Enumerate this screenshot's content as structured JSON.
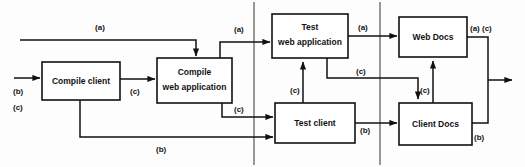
{
  "diagram": {
    "colors": {
      "background": "#fdfdfd",
      "stroke": "#111111",
      "box_fill": "#ffffff",
      "divider": "#555555"
    },
    "nodes": [
      {
        "id": "compile-client",
        "line1": "Compile client",
        "line2": ""
      },
      {
        "id": "compile-web-app",
        "line1": "Compile",
        "line2": "web application"
      },
      {
        "id": "test-web-app",
        "line1": "Test",
        "line2": "web application"
      },
      {
        "id": "test-client",
        "line1": "Test client",
        "line2": ""
      },
      {
        "id": "web-docs",
        "line1": "Web Docs",
        "line2": ""
      },
      {
        "id": "client-docs",
        "line1": "Client Docs",
        "line2": ""
      }
    ],
    "edge_labels": [
      {
        "id": "label-top-a",
        "text": "(a)"
      },
      {
        "id": "label-input-b",
        "text": "(b)"
      },
      {
        "id": "label-input-c",
        "text": "(c)"
      },
      {
        "id": "label-compile-chain-c",
        "text": "(c)"
      },
      {
        "id": "label-stage1-out-a",
        "text": "(a)"
      },
      {
        "id": "label-stage1-out-c",
        "text": "(c)"
      },
      {
        "id": "label-bottom-b",
        "text": "(b)"
      },
      {
        "id": "label-testweb-out-a",
        "text": "(a)"
      },
      {
        "id": "label-testweb-down-c",
        "text": "(c)"
      },
      {
        "id": "label-testweb-up-c",
        "text": "(c)"
      },
      {
        "id": "label-testclient-out-b",
        "text": "(b)"
      },
      {
        "id": "label-webdocs-out-ac",
        "text": "(a) (c)"
      },
      {
        "id": "label-clientdocs-up-c",
        "text": "(c)"
      },
      {
        "id": "label-clientdocs-out-b",
        "text": "(b)"
      }
    ],
    "dividers": [
      {
        "id": "divider-stage-1-2",
        "x": 254
      },
      {
        "id": "divider-stage-2-3",
        "x": 380
      }
    ]
  }
}
